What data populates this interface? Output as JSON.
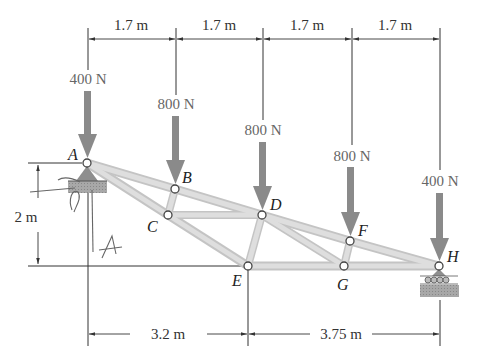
{
  "colors": {
    "member_fill": "#d9d9d9",
    "member_stroke": "#bdbdbd",
    "force_arrow": "#8a8a8a",
    "dimension_line": "#333333",
    "joint_fill": "#ffffff",
    "joint_stroke": "#444444",
    "support": "#9a9a9a"
  },
  "joints": [
    {
      "id": "A",
      "label": "A",
      "x": 87,
      "y": 163
    },
    {
      "id": "B",
      "label": "B",
      "x": 175,
      "y": 189
    },
    {
      "id": "C",
      "label": "C",
      "x": 168,
      "y": 215
    },
    {
      "id": "D",
      "label": "D",
      "x": 262,
      "y": 215
    },
    {
      "id": "E",
      "label": "E",
      "x": 248,
      "y": 266
    },
    {
      "id": "F",
      "label": "F",
      "x": 350,
      "y": 241
    },
    {
      "id": "G",
      "label": "G",
      "x": 344,
      "y": 266
    },
    {
      "id": "H",
      "label": "H",
      "x": 439,
      "y": 266
    }
  ],
  "members": [
    [
      "A",
      "B"
    ],
    [
      "B",
      "D"
    ],
    [
      "D",
      "F"
    ],
    [
      "F",
      "H"
    ],
    [
      "A",
      "C"
    ],
    [
      "C",
      "E"
    ],
    [
      "B",
      "C"
    ],
    [
      "C",
      "D"
    ],
    [
      "D",
      "E"
    ],
    [
      "D",
      "G"
    ],
    [
      "E",
      "G"
    ],
    [
      "G",
      "H"
    ],
    [
      "F",
      "G"
    ]
  ],
  "loads": [
    {
      "joint": "A",
      "label": "400 N"
    },
    {
      "joint": "B",
      "label": "800 N"
    },
    {
      "joint": "D",
      "label": "800 N"
    },
    {
      "joint": "F",
      "label": "800 N"
    },
    {
      "joint": "H",
      "label": "400 N"
    }
  ],
  "dimensions": {
    "top": [
      "1.7 m",
      "1.7 m",
      "1.7 m",
      "1.7 m"
    ],
    "bottom": [
      "3.2 m",
      "3.75 m"
    ],
    "height": "2 m"
  },
  "supports": {
    "A": "pin",
    "H": "roller"
  },
  "annotations": {
    "handwritten": "A"
  }
}
